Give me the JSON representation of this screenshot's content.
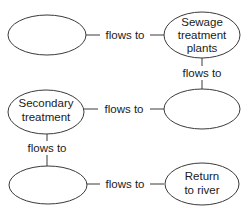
{
  "diagram": {
    "type": "flowchart",
    "nodes": [
      {
        "id": "n1",
        "lines": []
      },
      {
        "id": "n2",
        "lines": [
          "Sewage",
          "treatment",
          "plants"
        ]
      },
      {
        "id": "n3",
        "lines": []
      },
      {
        "id": "n4",
        "lines": [
          "Secondary",
          "treatment"
        ]
      },
      {
        "id": "n5",
        "lines": []
      },
      {
        "id": "n6",
        "lines": [
          "Return",
          "to river"
        ]
      }
    ],
    "edges": [
      {
        "from": "n1",
        "to": "n2",
        "label": "flows to"
      },
      {
        "from": "n2",
        "to": "n3",
        "label": "flows to"
      },
      {
        "from": "n4",
        "to": "n3",
        "label": "flows to"
      },
      {
        "from": "n4",
        "to": "n5",
        "label": "flows to"
      },
      {
        "from": "n5",
        "to": "n6",
        "label": "flows to"
      }
    ]
  }
}
